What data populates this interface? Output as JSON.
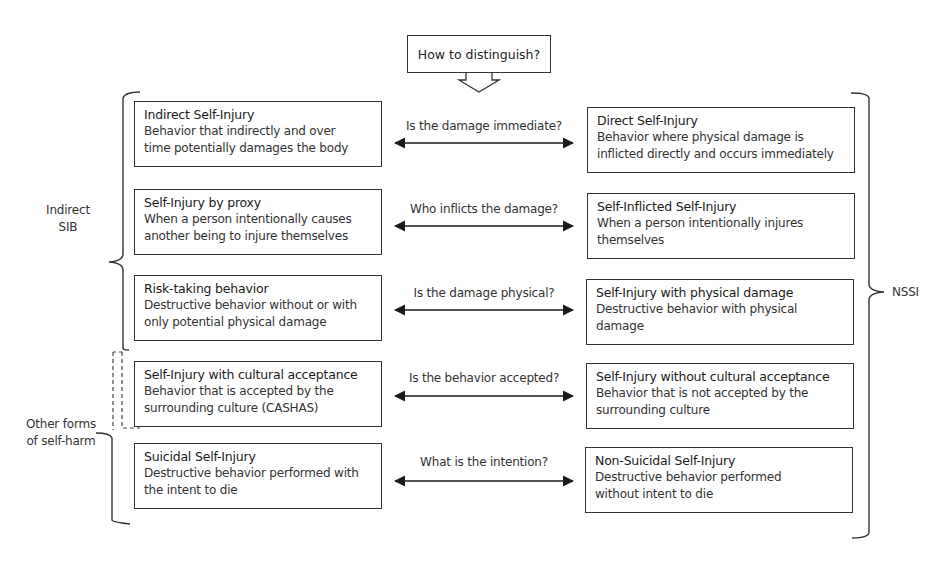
{
  "header": {
    "prompt": "How to distinguish?"
  },
  "rows": [
    {
      "left": {
        "title": "Indirect Self-Injury",
        "desc_line1": "Behavior that indirectly and over",
        "desc_line2": "time potentially damages the body"
      },
      "question": "Is the damage immediate?",
      "right": {
        "title": "Direct Self-Injury",
        "desc_line1": "Behavior where physical damage is",
        "desc_line2": "inflicted directly and occurs immediately"
      }
    },
    {
      "left": {
        "title": "Self-Injury by proxy",
        "desc_line1": "When a person intentionally causes",
        "desc_line2": "another being to injure themselves"
      },
      "question": "Who inflicts the damage?",
      "right": {
        "title": "Self-Inflicted Self-Injury",
        "desc_line1": "When a person intentionally injures",
        "desc_line2": "themselves"
      }
    },
    {
      "left": {
        "title": "Risk-taking behavior",
        "desc_line1": "Destructive behavior without or with",
        "desc_line2": "only potential physical damage"
      },
      "question": "Is the damage physical?",
      "right": {
        "title": "Self-Injury with physical damage",
        "desc_line1": "Destructive behavior with physical",
        "desc_line2": "damage"
      }
    },
    {
      "left": {
        "title": "Self-Injury with cultural acceptance",
        "desc_line1": "Behavior that is accepted by the",
        "desc_line2": "surrounding culture (CASHAS)"
      },
      "question": "Is the behavior accepted?",
      "right": {
        "title": "Self-Injury without cultural acceptance",
        "desc_line1": "Behavior that is not accepted by the",
        "desc_line2": "surrounding culture"
      }
    },
    {
      "left": {
        "title": "Suicidal Self-Injury",
        "desc_line1": "Destructive behavior performed with",
        "desc_line2": "the intent to die"
      },
      "question": "What is the intention?",
      "right": {
        "title": "Non-Suicidal Self-Injury",
        "desc_line1": "Destructive behavior performed",
        "desc_line2": "without intent to die"
      }
    }
  ],
  "brackets": {
    "indirect_sib": {
      "line1": "Indirect",
      "line2": "SIB"
    },
    "other_forms": {
      "line1": "Other forms",
      "line2": "of self-harm"
    },
    "nssi": {
      "label": "NSSI"
    }
  },
  "colors": {
    "stroke": "#333333",
    "text": "#222222",
    "background": "#ffffff"
  }
}
